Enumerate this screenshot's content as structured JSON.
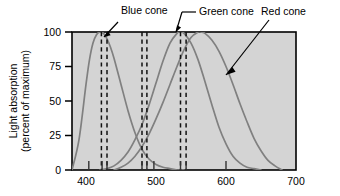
{
  "chart_data": {
    "type": "line",
    "title": "",
    "xlabel": "",
    "ylabel": "Light absorption (percent of maximum)",
    "ylabel_line1": "Light absorption",
    "ylabel_line2": "(percent of maximum)",
    "xlim": [
      380,
      700
    ],
    "ylim": [
      0,
      100
    ],
    "grid": false,
    "legend_position": "annotations-above-plot",
    "plot_background": "#d4d4d4",
    "x_ticks": [
      400,
      500,
      600,
      700
    ],
    "x_tick_labels": [
      "400",
      "500",
      "600",
      "700"
    ],
    "y_ticks": [
      0,
      25,
      50,
      75,
      100
    ],
    "y_tick_labels": [
      "0",
      "25",
      "50",
      "75",
      "100"
    ],
    "annotations": [
      {
        "text": "Blue cone",
        "points_to_nm": 432,
        "points_to_value": 93
      },
      {
        "text": "Green cone",
        "points_to_nm": 533,
        "points_to_value": 99
      },
      {
        "text": "Red cone",
        "points_to_nm": 625,
        "points_to_value": 72
      }
    ],
    "dashed_line_groups": [
      {
        "name": "blue-pair",
        "nm": [
          422,
          430
        ]
      },
      {
        "name": "middle-pair",
        "nm": [
          480,
          487
        ]
      },
      {
        "name": "green-red-pair",
        "nm": [
          535,
          543
        ]
      }
    ],
    "inner_x_markers_nm": [
      404,
      423,
      430,
      480,
      487,
      497,
      535,
      543,
      600
    ],
    "series": [
      {
        "name": "Blue cone",
        "color": "#808080",
        "peak_nm": 420,
        "x": [
          380,
          390,
          400,
          405,
          410,
          415,
          420,
          425,
          430,
          435,
          440,
          450,
          460,
          470,
          480,
          490,
          500,
          510,
          520,
          530,
          540
        ],
        "values": [
          0,
          22,
          62,
          80,
          92,
          98,
          100,
          99,
          95,
          89,
          81,
          62,
          43,
          27,
          15,
          8,
          4,
          2,
          1,
          0,
          0
        ]
      },
      {
        "name": "Green cone",
        "color": "#808080",
        "peak_nm": 534,
        "x": [
          420,
          430,
          440,
          450,
          460,
          470,
          480,
          490,
          500,
          510,
          520,
          530,
          534,
          540,
          550,
          560,
          570,
          580,
          590,
          600,
          610,
          620,
          630,
          640,
          650
        ],
        "values": [
          0,
          1,
          3,
          7,
          13,
          22,
          33,
          47,
          63,
          79,
          92,
          99,
          100,
          99,
          92,
          80,
          64,
          47,
          31,
          19,
          10,
          5,
          2,
          1,
          0
        ]
      },
      {
        "name": "Red cone",
        "color": "#808080",
        "peak_nm": 564,
        "x": [
          440,
          450,
          460,
          470,
          480,
          490,
          500,
          510,
          520,
          530,
          540,
          550,
          560,
          564,
          570,
          580,
          590,
          600,
          610,
          620,
          630,
          640,
          650,
          660,
          670,
          680
        ],
        "values": [
          0,
          2,
          5,
          10,
          17,
          26,
          37,
          49,
          62,
          75,
          87,
          96,
          100,
          100,
          99,
          94,
          86,
          75,
          62,
          48,
          35,
          23,
          14,
          7,
          3,
          0
        ]
      }
    ]
  }
}
